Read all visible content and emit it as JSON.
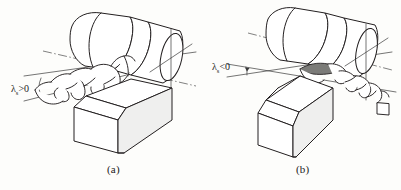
{
  "figure": {
    "background_color": "#fdfdfb",
    "line_color": "#231f20",
    "panels": [
      {
        "id": "a",
        "caption": "(a)",
        "angle_symbol": "λ",
        "angle_subscript": "s",
        "angle_condition": ">0",
        "angle_label_full": "λs>0",
        "chip_flow_direction": "left",
        "description": "Positive cutting edge inclination angle, chip flows toward the already machined surface on the left"
      },
      {
        "id": "b",
        "caption": "(b)",
        "angle_symbol": "λ",
        "angle_subscript": "s",
        "angle_condition": "<0",
        "angle_label_full": "λs<0",
        "chip_flow_direction": "right",
        "description": "Negative cutting edge inclination angle, chip flows toward the workpiece end on the right"
      }
    ],
    "components": {
      "workpiece": "stepped cylindrical bar",
      "tool": "single point turning tool block",
      "chip": "helical ribbon chip",
      "axis": "workpiece rotation centerline"
    }
  }
}
